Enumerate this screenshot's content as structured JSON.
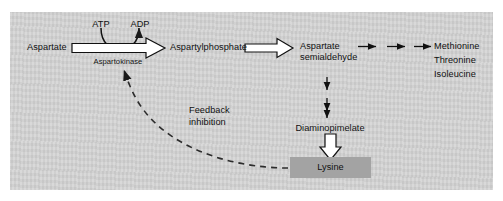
{
  "figure": {
    "panel_color": "#d5d5d5",
    "page_color": "#ffffff",
    "highlight_color": "#a3a3a3",
    "ink_color": "#111111"
  },
  "nodes": {
    "aspartate": "Aspartate",
    "aspartylphosphate": "Aspartylphosphate",
    "semialdehyde_line1": "Aspartate",
    "semialdehyde_line2": "semialdehyde",
    "diaminopimelate": "Diaminopimelate",
    "lysine": "Lysine",
    "methionine": "Methionine",
    "threonine": "Threonine",
    "isoleucine": "Isoleucine"
  },
  "cofactors": {
    "atp": "ATP",
    "adp": "ADP"
  },
  "enzymes": {
    "aspartokinase": "Aspartokinase"
  },
  "annotations": {
    "feedback_line1": "Feedback",
    "feedback_line2": "inhibition"
  },
  "icons": {
    "block_arrow_right_1": "block-arrow-right-icon",
    "block_arrow_right_2": "block-arrow-right-icon",
    "block_arrow_down": "block-arrow-down-icon",
    "curved_cofactor_arrow": "curved-arrow-icon",
    "chain_arrow_1": "arrow-right-icon",
    "chain_arrow_2": "arrow-right-icon",
    "chain_arrow_3": "arrow-right-icon",
    "down_arrow_1": "arrow-down-icon",
    "down_arrow_2": "arrow-down-icon",
    "down_arrow_3": "arrow-down-icon",
    "feedback_dashed_arrow": "dashed-inhibition-arrow-icon"
  }
}
